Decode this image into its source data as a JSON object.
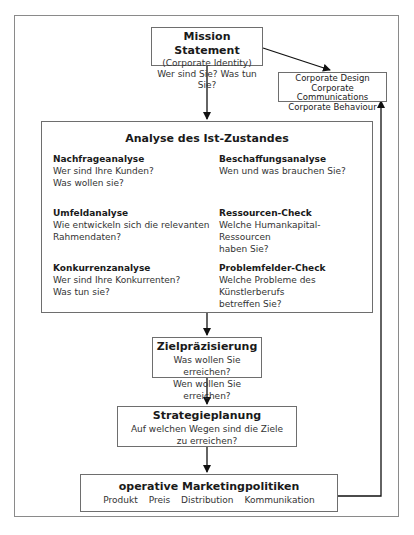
{
  "mission": {
    "title": "Mission Statement",
    "lines": [
      "(Corporate Identity)",
      "Wer sind Sie? Was tun Sie?"
    ]
  },
  "corporate": {
    "lines": [
      "Corporate Design",
      "Corporate Communications",
      "Corporate Behaviour"
    ]
  },
  "analysis": {
    "title": "Analyse des Ist-Zustandes",
    "cells": [
      {
        "heading": "Nachfrageanalyse",
        "lines": [
          "Wer sind Ihre Kunden?",
          "Was wollen sie?"
        ]
      },
      {
        "heading": "Beschaffungsanalyse",
        "lines": [
          "Wen und was brauchen Sie?"
        ]
      },
      {
        "heading": "Umfeldanalyse",
        "lines": [
          "Wie entwickeln sich die relevanten",
          "Rahmendaten?"
        ]
      },
      {
        "heading": "Ressourcen-Check",
        "lines": [
          "Welche Humankapital-Ressourcen",
          "haben Sie?"
        ]
      },
      {
        "heading": "Konkurrenzanalyse",
        "lines": [
          "Wer sind Ihre Konkurrenten?",
          "Was tun sie?"
        ]
      },
      {
        "heading": "Problemfelder-Check",
        "lines": [
          "Welche Probleme des Künstlerberufs",
          "betreffen Sie?"
        ]
      }
    ]
  },
  "ziel": {
    "title": "Zielpräzisierung",
    "lines": [
      "Was wollen Sie erreichen?",
      "Wen wollen Sie erreichen?"
    ]
  },
  "strategie": {
    "title": "Strategieplanung",
    "lines": [
      "Auf welchen Wegen sind die Ziele",
      "zu erreichen?"
    ]
  },
  "operative": {
    "title": "operative Marketingpolitiken",
    "items": [
      "Produkt",
      "Preis",
      "Distribution",
      "Kommunikation"
    ]
  }
}
